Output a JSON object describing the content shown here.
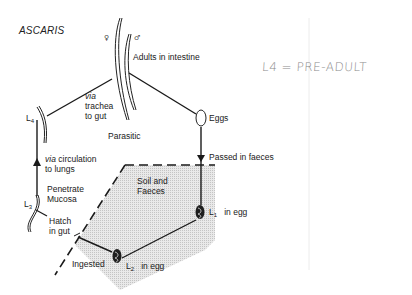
{
  "diagram": {
    "title": "ASCARIS",
    "nodes": {
      "adults": {
        "label": "Adults in intestine",
        "female_symbol": "♀",
        "male_symbol": "♂"
      },
      "eggs": {
        "label": "Eggs"
      },
      "l1": {
        "label_main": "L",
        "label_sub": "1",
        "suffix": "in egg"
      },
      "l2": {
        "label_main": "L",
        "label_sub": "2",
        "suffix": "in egg"
      },
      "l3": {
        "label_main": "L",
        "label_sub": "3"
      },
      "l4": {
        "label_main": "L",
        "label_sub": "4"
      }
    },
    "edges": {
      "trachea": {
        "line1": "via",
        "line2": "trachea",
        "line3": "to gut"
      },
      "parasitic": "Parasitic",
      "passed": "Passed in faeces",
      "soil": {
        "line1": "Soil and",
        "line2": "Faeces"
      },
      "ingested": "Ingested",
      "hatch": {
        "line1": "Hatch",
        "line2": "in gut"
      },
      "penetrate": {
        "line1": "Penetrate",
        "line2": "Mucosa"
      },
      "circulation": {
        "via": "via",
        "line1": "circulation",
        "line2": "to lungs"
      }
    },
    "annotation": "L4 = PRE-ADULT",
    "colors": {
      "ink": "#1a1a1a",
      "shade": "#d8d8d8",
      "pencil": "#8a8a8a",
      "margin_line": "#ececec"
    }
  }
}
